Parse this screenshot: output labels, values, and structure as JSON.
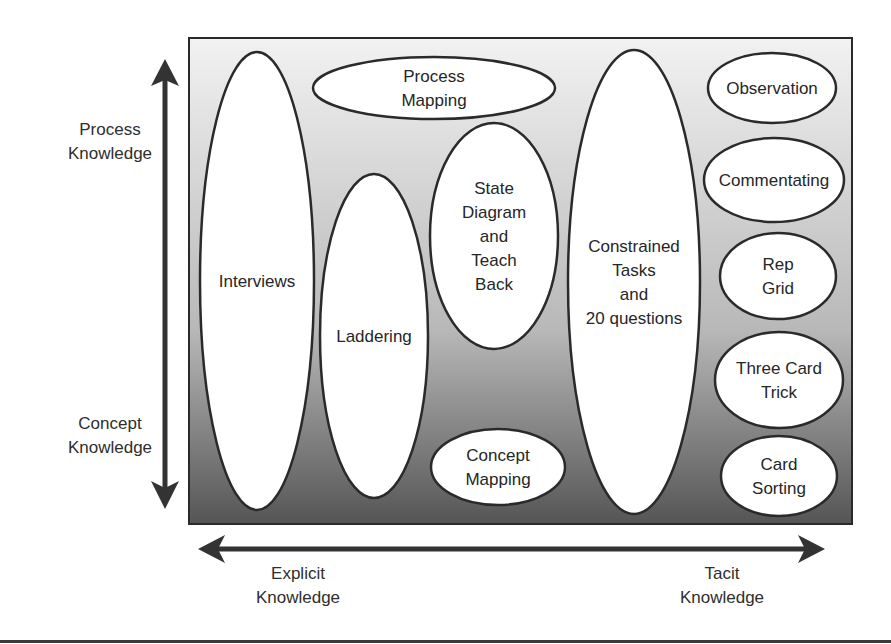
{
  "diagram": {
    "title": "",
    "colors": {
      "gradient_top": "#f2f2f2",
      "gradient_mid": "#b8b8b8",
      "gradient_bottom": "#555555",
      "border": "#2a2a2a",
      "ellipse_fill": "#ffffff",
      "arrow": "#333333"
    },
    "vertical_axis": {
      "top_label": [
        "Process",
        "Knowledge"
      ],
      "bottom_label": [
        "Concept",
        "Knowledge"
      ],
      "direction": "bidirectional"
    },
    "horizontal_axis": {
      "left_label": [
        "Explicit",
        "Knowledge"
      ],
      "right_label": [
        "Tacit",
        "Knowledge"
      ],
      "direction": "bidirectional"
    },
    "techniques": [
      {
        "id": "interviews",
        "lines": [
          "Interviews"
        ]
      },
      {
        "id": "process-mapping",
        "lines": [
          "Process",
          "Mapping"
        ]
      },
      {
        "id": "laddering",
        "lines": [
          "Laddering"
        ]
      },
      {
        "id": "state-diagram",
        "lines": [
          "State",
          "Diagram",
          "and",
          "Teach",
          "Back"
        ]
      },
      {
        "id": "concept-mapping",
        "lines": [
          "Concept",
          "Mapping"
        ]
      },
      {
        "id": "constrained-tasks",
        "lines": [
          "Constrained",
          "Tasks",
          "and",
          "20 questions"
        ]
      },
      {
        "id": "observation",
        "lines": [
          "Observation"
        ]
      },
      {
        "id": "commentating",
        "lines": [
          "Commentating"
        ]
      },
      {
        "id": "rep-grid",
        "lines": [
          "Rep",
          "Grid"
        ]
      },
      {
        "id": "three-card-trick",
        "lines": [
          "Three Card",
          "Trick"
        ]
      },
      {
        "id": "card-sorting",
        "lines": [
          "Card",
          "Sorting"
        ]
      }
    ]
  }
}
